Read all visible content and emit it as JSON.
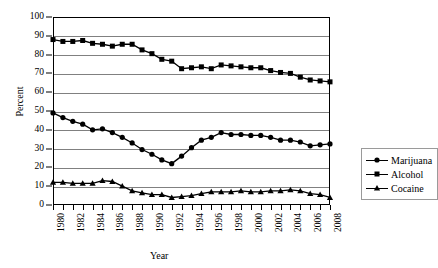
{
  "chart_data": {
    "type": "line",
    "title": "",
    "xlabel": "Year",
    "ylabel": "Percent",
    "ylim": [
      0,
      100
    ],
    "ytick_step": 10,
    "yticks": [
      0,
      10,
      20,
      30,
      40,
      50,
      60,
      70,
      80,
      90,
      100
    ],
    "grid": "horizontal",
    "legend_position": "right",
    "x": [
      1980,
      1981,
      1982,
      1983,
      1984,
      1985,
      1986,
      1987,
      1988,
      1989,
      1990,
      1991,
      1992,
      1993,
      1994,
      1995,
      1996,
      1997,
      1998,
      1999,
      2000,
      2001,
      2002,
      2003,
      2004,
      2005,
      2006,
      2007,
      2008
    ],
    "xtick_labels": [
      "1980",
      "1982",
      "1984",
      "1986",
      "1988",
      "1990",
      "1992",
      "1994",
      "1996",
      "1998",
      "2000",
      "2002",
      "2004",
      "2006",
      "2008"
    ],
    "xlim": [
      1980,
      2008
    ],
    "series": [
      {
        "name": "Marijuana",
        "marker": "circle",
        "values": [
          49,
          46.5,
          44.5,
          43,
          40,
          40.5,
          38.5,
          36,
          33,
          29.5,
          27,
          24,
          22,
          26,
          30.5,
          34.5,
          36,
          38.5,
          37.5,
          37.5,
          37,
          37,
          36,
          34.5,
          34.5,
          33.5,
          31.5,
          32,
          32.5
        ]
      },
      {
        "name": "Alcohol",
        "marker": "square",
        "values": [
          88,
          87,
          87,
          87.5,
          86,
          85.5,
          84.5,
          85.5,
          85.5,
          82.5,
          80.5,
          77.5,
          76.5,
          72.5,
          73,
          73.5,
          72.5,
          74.5,
          74,
          73.5,
          73,
          73,
          71.5,
          70.5,
          70,
          68,
          66.5,
          66,
          65.5
        ]
      },
      {
        "name": "Cocaine",
        "marker": "triangle",
        "values": [
          12,
          12,
          11.5,
          11.5,
          11.5,
          13,
          12.5,
          10,
          7.5,
          6.5,
          5.5,
          5.5,
          4,
          4.5,
          5,
          6,
          7,
          7,
          7,
          7.5,
          7,
          7,
          7.5,
          7.5,
          8,
          7.5,
          6,
          5.5,
          4
        ]
      }
    ]
  },
  "legend": {
    "items": [
      {
        "label": "Marijuana"
      },
      {
        "label": "Alcohol"
      },
      {
        "label": "Cocaine"
      }
    ]
  }
}
